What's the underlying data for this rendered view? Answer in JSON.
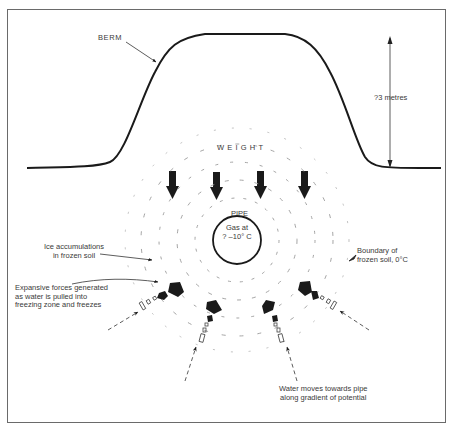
{
  "figure": {
    "labels": {
      "berm": "BERM",
      "height": "?3 metres",
      "weight": "WEIGHT",
      "pipe": "PIPE",
      "gas_line1": "Gas at",
      "gas_line2": "? –10° C",
      "ice_line1": "Ice accumulations",
      "ice_line2": "in frozen soil",
      "boundary_line1": "Boundary of",
      "boundary_line2": "frozen soil, 0°C",
      "expansive_line1": "Expansive forces generated",
      "expansive_line2": "as water is pulled into",
      "expansive_line3": "freezing zone and freezes",
      "water_line1": "Water moves towards pipe",
      "water_line2": "along gradient of potential"
    },
    "colors": {
      "ink": "#1a1a1a",
      "text": "#3a3a3a",
      "frame": "#6a6a6a",
      "background": "#ffffff"
    },
    "weight_arrow_count": 4,
    "water_flow_arrow_count": 4
  }
}
